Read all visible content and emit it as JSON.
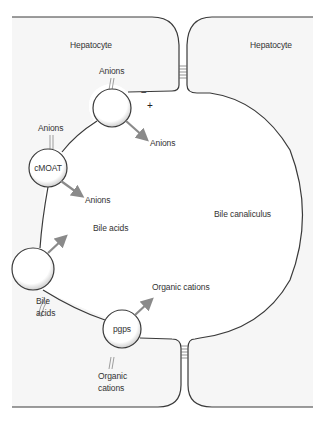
{
  "diagram": {
    "cells": {
      "left_label": "Hepatocyte",
      "right_label": "Hepatocyte"
    },
    "lumen_label": "Bile canaliculus",
    "membrane_potential": {
      "negative": "−",
      "positive": "+"
    },
    "transporters": [
      {
        "id": "anion-transporter",
        "name": "",
        "input_label": "Anions",
        "output_label": "Anions"
      },
      {
        "id": "cmoat",
        "name": "cMOAT",
        "input_label": "Anions",
        "output_label": "Anions"
      },
      {
        "id": "bile-acid-transporter",
        "name": "",
        "input_label_line1": "Bile",
        "input_label_line2": "acids",
        "output_label": "Bile acids"
      },
      {
        "id": "pgps",
        "name": "pgps",
        "input_label_line1": "Organic",
        "input_label_line2": "cations",
        "output_label": "Organic cations"
      }
    ],
    "colors": {
      "cytoplasm": "#f6f6f6",
      "lumen": "#ffffff",
      "membrane": "#3a3a3a",
      "arrow": "#8a8a8a",
      "text": "#333333"
    }
  }
}
